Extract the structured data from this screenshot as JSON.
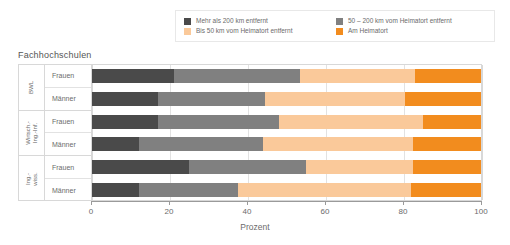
{
  "chart_data": {
    "type": "bar",
    "orientation": "horizontal",
    "stacked": true,
    "stacked_percent": true,
    "title": "Fachhochschulen",
    "xlabel": "Prozent",
    "ylabel": "",
    "xlim": [
      0,
      100
    ],
    "xticks": [
      0,
      20,
      40,
      60,
      80,
      100
    ],
    "xtick_labels": [
      "0",
      "20",
      "40",
      "60",
      "80",
      "100"
    ],
    "grid": true,
    "legend_position": "top",
    "series": [
      {
        "name": "Mehr als 200 km entfernt",
        "color": "#4a4a4a",
        "values": [
          21,
          17,
          17,
          12,
          25,
          12
        ]
      },
      {
        "name": "50 – 200 km vom Heimatort entfernt",
        "color": "#808080",
        "values": [
          32.5,
          27.5,
          31,
          32,
          30,
          25.5
        ]
      },
      {
        "name": "Bis 50 km vom Heimatort entfernt",
        "color": "#fac99a",
        "values": [
          29.5,
          36,
          37,
          38.5,
          27.5,
          44.5
        ]
      },
      {
        "name": "Am Heimatort",
        "color": "#f28c1e",
        "values": [
          17,
          19.5,
          15,
          17.5,
          17.5,
          18
        ]
      }
    ],
    "groups": [
      {
        "label": "BWL",
        "rows": [
          "Frauen",
          "Männer"
        ]
      },
      {
        "label": "Wirtsch.-\nIng.-Inf.",
        "rows": [
          "Frauen",
          "Männer"
        ]
      },
      {
        "label": "Ing.-\nwiss.",
        "rows": [
          "Frauen",
          "Männer"
        ]
      }
    ],
    "categories": [
      "BWL Frauen",
      "BWL Männer",
      "Wirtsch.-Ing.-Inf. Frauen",
      "Wirtsch.-Ing.-Inf. Männer",
      "Ing.-wiss. Frauen",
      "Ing.-wiss. Männer"
    ]
  },
  "legend": {
    "items": [
      {
        "label": "Mehr als 200 km entfernt",
        "color": "#4a4a4a"
      },
      {
        "label": "50 – 200 km vom Heimatort entfernt",
        "color": "#808080"
      },
      {
        "label": "Bis 50 km vom Heimatort entfernt",
        "color": "#fac99a"
      },
      {
        "label": "Am Heimatort",
        "color": "#f28c1e"
      }
    ]
  },
  "groups": {
    "g0": {
      "label_line1": "BWL",
      "label_line2": ""
    },
    "g1": {
      "label_line1": "Wirtsch.-",
      "label_line2": "Ing.-Inf."
    },
    "g2": {
      "label_line1": "Ing.-",
      "label_line2": "wiss."
    }
  },
  "rows": {
    "frauen": "Frauen",
    "maenner": "Männer"
  }
}
